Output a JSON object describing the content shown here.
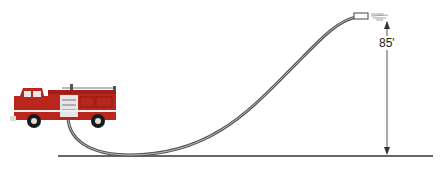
{
  "diagram": {
    "height_label": "85'",
    "elements": [
      "fire-truck",
      "hose",
      "nozzle",
      "water-spray",
      "height-dimension-arrow",
      "ground-line"
    ],
    "colors": {
      "truck_red": "#b8261e",
      "hose": "#555555",
      "ground": "#666666"
    }
  }
}
